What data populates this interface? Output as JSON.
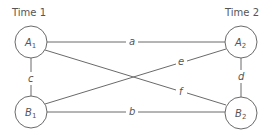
{
  "titles": {
    "left": "Time 1",
    "right": "Time 2"
  },
  "nodes": {
    "A1": {
      "letter": "A",
      "sub": "1"
    },
    "A2": {
      "letter": "A",
      "sub": "2"
    },
    "B1": {
      "letter": "B",
      "sub": "1"
    },
    "B2": {
      "letter": "B",
      "sub": "2"
    }
  },
  "edges": {
    "a": "a",
    "b": "b",
    "c": "c",
    "d": "d",
    "e": "e",
    "f": "f"
  },
  "colors": {
    "stroke": "#6a6a6a",
    "text": "#555555"
  }
}
